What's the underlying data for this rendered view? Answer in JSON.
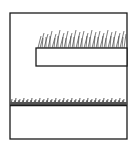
{
  "diagram": {
    "colors": {
      "line": "#1a1a1a",
      "grass": "#333333",
      "background": "#ffffff"
    },
    "elements": [
      {
        "name": "outer-frame",
        "x": 10,
        "y": 13,
        "w": 117,
        "h": 126
      },
      {
        "name": "raised-ledge",
        "x": 36,
        "y": 48,
        "w": 91,
        "h": 18,
        "grass": "tall"
      },
      {
        "name": "ground-line",
        "y": 105,
        "x1": 10,
        "x2": 127,
        "grass": "short"
      }
    ]
  }
}
